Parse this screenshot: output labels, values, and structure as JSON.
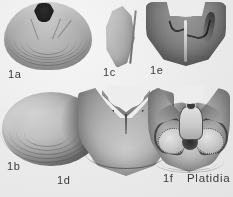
{
  "plate": {
    "genus_label": "Platidia",
    "background_color": "#f2f1ee",
    "ink_color": "#3b3a38",
    "figures": [
      {
        "id": "1a",
        "label": "1a",
        "view": "dorsal-valve-exterior",
        "description": "Rounded shell with concentric growth lines and dark pentagonal foramen at the umbo"
      },
      {
        "id": "1c",
        "label": "1c",
        "view": "lateral-profile",
        "description": "Narrow crescent-shaped side view of the shell"
      },
      {
        "id": "1e",
        "label": "1e",
        "view": "ventral-valve-interior",
        "description": "U-shaped valve interior showing median septum and sockets"
      },
      {
        "id": "1b",
        "label": "1b",
        "view": "oval-shell-exterior",
        "description": "Oval shell with growth lines and dark shading on right flank"
      },
      {
        "id": "1d",
        "label": "1d",
        "view": "cardinal-area",
        "description": "Wide shell with notched cardinal area and V-shaped septal structure"
      },
      {
        "id": "1f",
        "label": "1f",
        "view": "brachidium-interior",
        "description": "Interior showing cardinal plate, foramen and paired crenulated brachial loops"
      }
    ]
  }
}
